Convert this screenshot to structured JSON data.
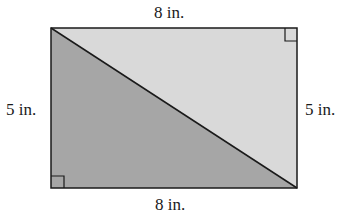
{
  "diagram": {
    "shape": "rectangle divided by diagonal into two right triangles",
    "labels": {
      "top": "8 in.",
      "bottom": "8 in.",
      "left": "5 in.",
      "right": "5 in."
    },
    "colors": {
      "background": "#ffffff",
      "upper_triangle_fill": "#d9d9d9",
      "lower_triangle_fill": "#a6a6a6",
      "stroke": "#1a1a1a"
    },
    "right_angle_markers": [
      "bottom-left",
      "top-right"
    ]
  }
}
